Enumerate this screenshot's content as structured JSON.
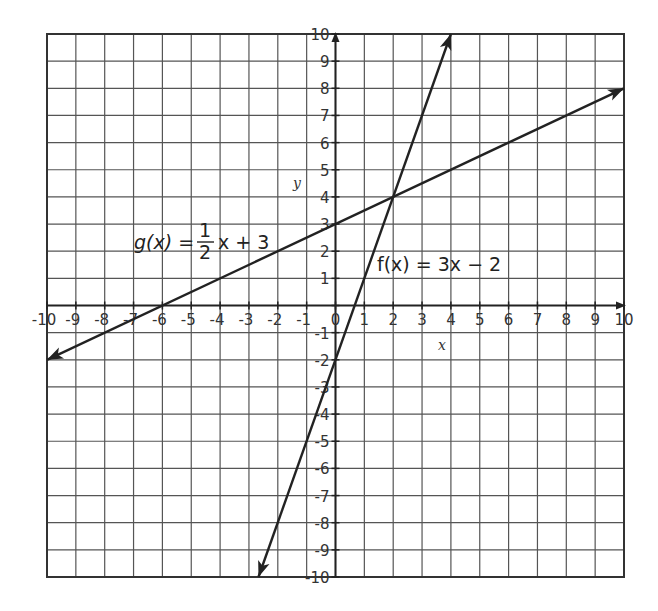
{
  "chart_data": {
    "type": "line",
    "title": "",
    "xlabel": "x",
    "ylabel": "y",
    "xlim": [
      -10,
      10
    ],
    "ylim": [
      -10,
      10
    ],
    "grid": true,
    "x_ticks": [
      -10,
      -9,
      -8,
      -7,
      -6,
      -5,
      -4,
      -3,
      -2,
      -1,
      0,
      1,
      2,
      3,
      4,
      5,
      6,
      7,
      8,
      9,
      10
    ],
    "y_ticks": [
      -10,
      -9,
      -8,
      -7,
      -6,
      -5,
      -4,
      -3,
      -2,
      -1,
      1,
      2,
      3,
      4,
      5,
      6,
      7,
      8,
      9,
      10
    ],
    "x_tick_labels": [
      "-10",
      "-9",
      "-8",
      "-7",
      "-6",
      "-5",
      "-4",
      "-3",
      "-2",
      "-1",
      "0",
      "1",
      "2",
      "3",
      "4",
      "5",
      "6",
      "7",
      "8",
      "9",
      "10"
    ],
    "y_tick_labels": [
      "-10",
      "-9",
      "-8",
      "-7",
      "-6",
      "-5",
      "-4",
      "-3",
      "-2",
      "-1",
      "1",
      "2",
      "3",
      "4",
      "5",
      "6",
      "7",
      "8",
      "9",
      "10"
    ],
    "series": [
      {
        "name": "g(x) = 1/2 x + 3",
        "label_func": "g(x)",
        "label_num": "1",
        "label_den": "2",
        "label_rest": "x + 3",
        "slope": 0.5,
        "intercept": 3,
        "x": [
          -10,
          10
        ],
        "y": [
          -2,
          8
        ],
        "arrows": "both"
      },
      {
        "name": "f(x) = 3x - 2",
        "label": "f(x) = 3x − 2",
        "slope": 3,
        "intercept": -2,
        "x": [
          -2.67,
          4
        ],
        "y": [
          -10,
          10
        ],
        "arrows": "both"
      }
    ],
    "annotations": [
      {
        "text": "intersection",
        "x": 2,
        "y": 4
      }
    ],
    "legend": "none (inline labels)"
  }
}
